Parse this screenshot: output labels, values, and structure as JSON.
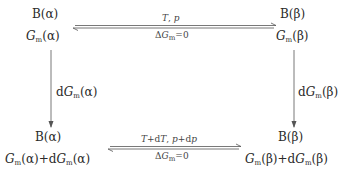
{
  "diagram": {
    "nodes": {
      "top_left": {
        "species": "B(α)",
        "gibbs": "G_m(α)",
        "gibbs_parts": {
          "symbol": "G",
          "sub": "m",
          "phase": "(α)"
        }
      },
      "top_right": {
        "species": "B(β)",
        "gibbs": "G_m(β)",
        "gibbs_parts": {
          "symbol": "G",
          "sub": "m",
          "phase": "(β)"
        }
      },
      "bottom_left": {
        "species": "B(α)",
        "gibbs": "G_m(α)+dG_m(α)",
        "gibbs_parts": {
          "symbol": "G",
          "sub": "m",
          "phase": "(α)",
          "plus": "+d",
          "phase2": "(α)"
        }
      },
      "bottom_right": {
        "species": "B(β)",
        "gibbs": "G_m(β)+dG_m(β)",
        "gibbs_parts": {
          "symbol": "G",
          "sub": "m",
          "phase": "(β)",
          "plus": "+d",
          "phase2": "(β)"
        }
      }
    },
    "edges": {
      "top": {
        "type": "equilibrium-double-arrow",
        "above": "T, p",
        "below": "ΔG_m=0",
        "above_parts": {
          "T": "T",
          "sep": ", ",
          "p": "p"
        },
        "below_parts": {
          "delta": "Δ",
          "symbol": "G",
          "sub": "m",
          "eq": "=0"
        }
      },
      "bottom": {
        "type": "equilibrium-double-arrow",
        "above": "T+dT, p+dp",
        "below": "ΔG_m=0",
        "above_parts": {
          "T": "T",
          "plusd1": "+d",
          "T2": "T",
          "sep": ", ",
          "p": "p",
          "plusd2": "+d",
          "p2": "p"
        },
        "below_parts": {
          "delta": "Δ",
          "symbol": "G",
          "sub": "m",
          "eq": "=0"
        }
      },
      "left": {
        "type": "down-arrow",
        "label": "dG_m(α)",
        "label_parts": {
          "d": "d",
          "symbol": "G",
          "sub": "m",
          "phase": "(α)"
        }
      },
      "right": {
        "type": "down-arrow",
        "label": "dG_m(β)",
        "label_parts": {
          "d": "d",
          "symbol": "G",
          "sub": "m",
          "phase": "(β)"
        }
      }
    },
    "colors": {
      "ink": "#2a2a2a",
      "line": "#555555"
    }
  }
}
